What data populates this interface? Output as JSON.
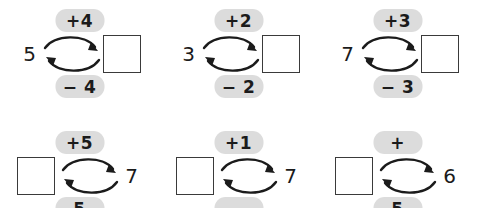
{
  "worksheet": {
    "type": "number-bond-inverse-operations",
    "pill_color": "#dcdcdc",
    "box_border_color": "#3a3a3a",
    "rows": [
      {
        "row_index": 1,
        "clipped": false,
        "cells": [
          {
            "id": "problem-1",
            "layout": "value-left-box-right",
            "top_label": "+4",
            "bottom_label": "− 4",
            "value": "5",
            "answer": ""
          },
          {
            "id": "problem-2",
            "layout": "value-left-box-right",
            "top_label": "+2",
            "bottom_label": "− 2",
            "value": "3",
            "answer": ""
          },
          {
            "id": "problem-3",
            "layout": "value-left-box-right",
            "top_label": "+3",
            "bottom_label": "− 3",
            "value": "7",
            "answer": ""
          }
        ]
      },
      {
        "row_index": 2,
        "clipped": true,
        "cells": [
          {
            "id": "problem-4",
            "layout": "box-left-value-right",
            "top_label": "+5",
            "bottom_label": "5",
            "value": "7",
            "answer": ""
          },
          {
            "id": "problem-5",
            "layout": "box-left-value-right",
            "top_label": "+1",
            "bottom_label": "",
            "value": "7",
            "answer": ""
          },
          {
            "id": "problem-6",
            "layout": "box-left-value-right",
            "top_label": "+",
            "bottom_label": "5",
            "value": "6",
            "answer": ""
          }
        ]
      }
    ]
  }
}
